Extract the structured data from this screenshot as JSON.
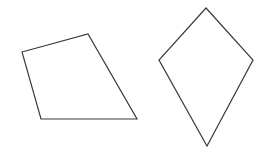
{
  "diagram": {
    "shapes": [
      {
        "id": "quadrilateral",
        "kind": "irregular-quadrilateral",
        "vertex_count": 4,
        "stroke": "#3a3a3a",
        "fill": "none"
      },
      {
        "id": "kite",
        "kind": "kite",
        "vertex_count": 4,
        "stroke": "#3a3a3a",
        "fill": "none"
      }
    ]
  }
}
